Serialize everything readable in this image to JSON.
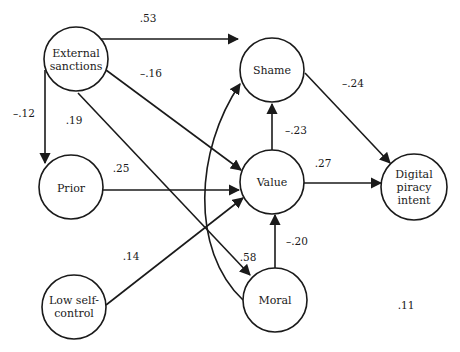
{
  "diagram": {
    "type": "path-model",
    "nodes": [
      {
        "id": "external",
        "label_lines": [
          "External",
          "sanctions"
        ],
        "cx": 76,
        "cy": 59
      },
      {
        "id": "shame",
        "label_lines": [
          "Shame"
        ],
        "cx": 272,
        "cy": 70
      },
      {
        "id": "prior",
        "label_lines": [
          "Prior"
        ],
        "cx": 71,
        "cy": 187
      },
      {
        "id": "value",
        "label_lines": [
          "Value"
        ],
        "cx": 272,
        "cy": 182
      },
      {
        "id": "intent",
        "label_lines": [
          "Digital",
          "piracy",
          "intent"
        ],
        "cx": 414,
        "cy": 187
      },
      {
        "id": "lowself",
        "label_lines": [
          "Low self-",
          "control"
        ],
        "cx": 74,
        "cy": 307
      },
      {
        "id": "moral",
        "label_lines": [
          "Moral"
        ],
        "cx": 275,
        "cy": 300
      }
    ],
    "edges": [
      {
        "from": "external",
        "to": "shame",
        "coef": ".53"
      },
      {
        "from": "external",
        "to": "value",
        "coef": "–.16"
      },
      {
        "from": "external",
        "to": "prior",
        "coef": "–.12"
      },
      {
        "from": "external",
        "to": "moral",
        "coef": ".19"
      },
      {
        "from": "prior",
        "to": "value",
        "coef": ".25"
      },
      {
        "from": "lowself",
        "to": "value",
        "coef": ".14"
      },
      {
        "from": "value",
        "to": "shame",
        "coef": "–.23"
      },
      {
        "from": "value",
        "to": "intent",
        "coef": ".27"
      },
      {
        "from": "shame",
        "to": "intent",
        "coef": "–.24"
      },
      {
        "from": "moral",
        "to": "value",
        "coef": "–.20"
      },
      {
        "from": "moral",
        "to": "shame",
        "coef": ".58",
        "curved": true
      }
    ],
    "labels": {
      "n_external_1": "External",
      "n_external_2": "sanctions",
      "n_shame": "Shame",
      "n_prior": "Prior",
      "n_value": "Value",
      "n_intent_1": "Digital",
      "n_intent_2": "piracy",
      "n_intent_3": "intent",
      "n_lowself_1": "Low self-",
      "n_lowself_2": "control",
      "n_moral": "Moral",
      "c_ext_shame": ".53",
      "c_ext_value": "–.16",
      "c_ext_prior": "–.12",
      "c_ext_moral": ".19",
      "c_prior_value": ".25",
      "c_low_value": ".14",
      "c_value_shame": "–.23",
      "c_value_intent": ".27",
      "c_shame_intent": "–.24",
      "c_moral_value": "–.20",
      "c_moral_curve": ".58",
      "r_squared": ".11"
    },
    "stroke_color": "#1a1a1a",
    "background": "#ffffff"
  }
}
